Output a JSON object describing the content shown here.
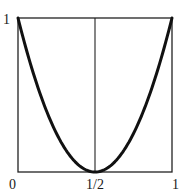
{
  "chart_data": {
    "type": "line",
    "title": "",
    "xlabel": "",
    "ylabel": "",
    "xlim": [
      0,
      1
    ],
    "ylim": [
      0,
      1
    ],
    "grid": false,
    "legend": null,
    "x_ticks": [
      "0",
      "1/2",
      "1"
    ],
    "y_ticks": [
      "1"
    ],
    "reference_lines": [
      {
        "orientation": "vertical",
        "x": 0.5
      }
    ],
    "series": [
      {
        "name": "curve",
        "x": [
          0,
          0.1,
          0.2,
          0.3,
          0.4,
          0.5,
          0.6,
          0.7,
          0.8,
          0.9,
          1.0
        ],
        "values": [
          1,
          0.64,
          0.36,
          0.16,
          0.04,
          0,
          0.04,
          0.16,
          0.36,
          0.64,
          1
        ]
      }
    ]
  },
  "labels": {
    "x0": "0",
    "xhalf": "1/2",
    "x1": "1",
    "y1": "1"
  },
  "colors": {
    "line": "#111111",
    "frame": "#222222",
    "background": "#ffffff"
  }
}
